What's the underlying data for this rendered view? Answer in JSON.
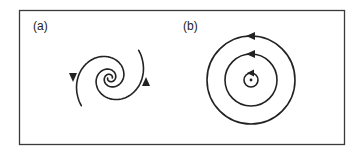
{
  "figure": {
    "panels": [
      {
        "id": "a",
        "label": "(a)",
        "description": "stable spiral (focus): trajectories spiral inward toward the center",
        "curve_type": "double-armed logarithmic spiral",
        "direction": "inward",
        "arrow_count": 2
      },
      {
        "id": "b",
        "label": "(b)",
        "description": "center: closed concentric orbits around a fixed point",
        "curve_type": "concentric circles",
        "orbit_count": 3,
        "direction": "counterclockwise",
        "arrow_count": 3,
        "center_point": true
      }
    ],
    "colors": {
      "line": "#222222",
      "frame": "#3a3a3a",
      "background": "#ffffff"
    }
  }
}
